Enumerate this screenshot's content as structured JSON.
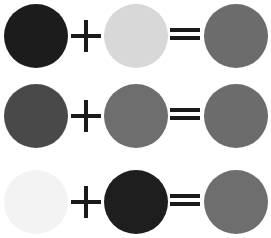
{
  "equations": [
    {
      "left_color": "#1c1c1c",
      "right_color": "#d8d8d8",
      "result_color": "#6c6c6c",
      "operator": "+",
      "equals": "="
    },
    {
      "left_color": "#494949",
      "right_color": "#6e6e6e",
      "result_color": "#6c6c6c",
      "operator": "+",
      "equals": "="
    },
    {
      "left_color": "#f3f3f3",
      "right_color": "#1e1e1e",
      "result_color": "#6e6e6e",
      "operator": "+",
      "equals": "="
    }
  ],
  "symbol_color": "#1a1a1a"
}
